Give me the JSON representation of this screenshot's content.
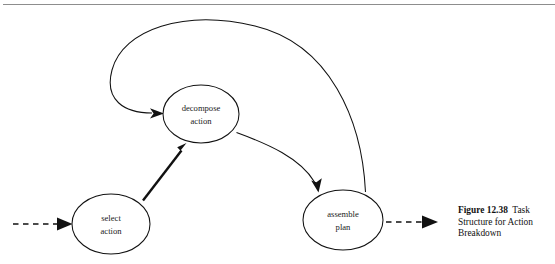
{
  "figure": {
    "type": "state-transition-diagram",
    "caption_label": "Figure 12.38",
    "caption_text": "Task Structure for Action Breakdown",
    "caption_full": "Figure 12.38  Task Structure for Action Breakdown",
    "top_rule_color": "#8d8d8d",
    "stroke_color": "#111111",
    "background_color": "#ffffff"
  },
  "nodes": [
    {
      "id": "select-action",
      "line1": "select",
      "line2": "action",
      "cx": 111,
      "cy": 224,
      "rx": 39,
      "ry": 30
    },
    {
      "id": "decompose-action",
      "line1": "decompose",
      "line2": "action",
      "cx": 201,
      "cy": 114,
      "rx": 38,
      "ry": 29
    },
    {
      "id": "assemble-plan",
      "line1": "assemble",
      "line2": "plan",
      "cx": 343,
      "cy": 220,
      "rx": 40,
      "ry": 30
    }
  ],
  "edges": [
    {
      "id": "entry-arrow",
      "from": "external",
      "to": "select-action",
      "style": "dashed"
    },
    {
      "id": "select-to-decompose",
      "from": "select-action",
      "to": "decompose-action",
      "style": "thick-solid"
    },
    {
      "id": "decompose-to-assemble",
      "from": "decompose-action",
      "to": "assemble-plan",
      "style": "curved-solid"
    },
    {
      "id": "assemble-to-decompose",
      "from": "assemble-plan",
      "to": "decompose-action",
      "style": "curved-solid-loop"
    },
    {
      "id": "exit-arrow",
      "from": "assemble-plan",
      "to": "external",
      "style": "dashed"
    }
  ]
}
